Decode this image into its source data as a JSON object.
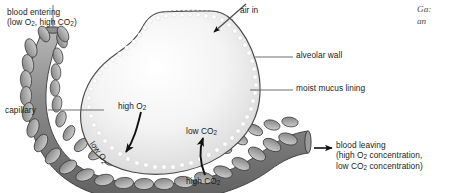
{
  "figure": {
    "domain": "biology-diagram",
    "background_color": "#ffffff",
    "ink_color": "#1b1b1b"
  },
  "labels": {
    "blood_entering": {
      "line1": "blood entering",
      "line2_pre": "(low O",
      "line2_sub1": "2",
      "line2_mid": ", high CO",
      "line2_sub2": "2",
      "line2_post": ")"
    },
    "air_in": "air in",
    "alveolar_wall": "alveolar wall",
    "moist_mucus_lining": "moist mucus lining",
    "capillary": "capillary",
    "high_o2": {
      "text": "high O",
      "sub": "2"
    },
    "low_o2": {
      "text": "low O",
      "sub": "2"
    },
    "low_co2": {
      "text": "low CO",
      "sub": "2"
    },
    "high_co2": {
      "text": "high CO",
      "sub": "2"
    },
    "blood_leaving": {
      "line1": "blood leaving",
      "line2_pre": "(high O",
      "line2_sub": "2",
      "line2_post": " concentration,",
      "line3_pre": "low CO",
      "line3_sub": "2",
      "line3_post": " concentration)"
    }
  },
  "caption_fragment": {
    "line1": "Ga:",
    "line2": "an",
    "color": "#4a4a4a"
  },
  "colors": {
    "alveolus_fill_light": "#fdfdfd",
    "alveolus_fill_mid": "#e2e2e2",
    "alveolus_outline": "#4a4a4a",
    "mucus_dots": "#ffffff",
    "capillary_fill_dark": "#6f6f6f",
    "capillary_fill_light": "#c9c9c9",
    "capillary_outline": "#3a3a3a",
    "endothelial_cell": "#b0b0b0",
    "arrow_gray": "#9a9a9a",
    "arrow_black": "#111111",
    "leader_line": "#555555"
  }
}
